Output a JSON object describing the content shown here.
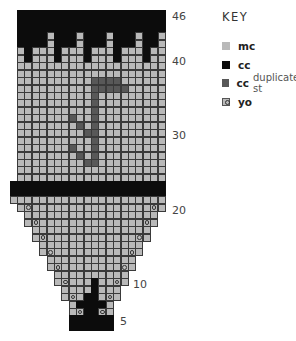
{
  "key": {
    "title": "KEY",
    "items": [
      {
        "name": "mc",
        "label": "mc",
        "sub": "",
        "color": "#b9b9b9",
        "type": "square"
      },
      {
        "name": "cc",
        "label": "cc",
        "sub": "",
        "color": "#0c0c0c",
        "type": "square"
      },
      {
        "name": "cc-duplicate",
        "label": "cc",
        "sub": "duplicate st",
        "color": "#585858",
        "type": "square"
      },
      {
        "name": "yo",
        "label": "yo",
        "sub": "",
        "color": "#b9b9b9",
        "type": "circle"
      }
    ]
  },
  "chart_data": {
    "type": "heatmap",
    "cols": 21,
    "row_min": 4,
    "row_max": 46,
    "row_labels": [
      46,
      40,
      30,
      20,
      10,
      5
    ],
    "legend": {
      "M": "mc",
      "C": "cc",
      "D": "cc duplicate st",
      "O": "yo",
      ".": "none"
    },
    "rows": {
      "46": ".CCCCCCCCCCCCCCCCCCCC",
      "45": ".CCCCCCCCCCCCCCCCCCCC",
      "44": ".CCCCCCCCCCCCCCCCCCCC",
      "43": ".CCCCMCCCMCCCMCCCMCCM",
      "42": ".CCCCMCCCMCCCMCCCMCCM",
      "41": ".MCMMMCMMMCMMMCMMMCMM",
      "40": ".MCMMMCMMMCMMMCMMMCMM",
      "39": ".MMMMMMMMMMMMMMMMMMMM",
      "38": ".MMMMMMMMMMMMMMMMMMMM",
      "37": ".MMMMMMMMMMDDDDMMMMMM",
      "36": ".MMMMMMMMMMDDDDDMMMMM",
      "35": ".MMMMMMMMMMDMMMMMMMMM",
      "34": ".MMMMMMMMMMDMMMMMMMMM",
      "33": ".MMMMMMMMMMDMMMMMMMMM",
      "32": ".MMMMMMMDMMDMMMMMMMMM",
      "31": ".MMMMMMMMDMDMMMMMMMMM",
      "30": ".MMMMMMMMMDDMMMMMMMMM",
      "29": ".MMMMMMMMMMDMMMMMMMMM",
      "28": ".MMMMMMMDMMDMMMMMMMMM",
      "27": ".MMMMMMMMDMDMMMMMMMMM",
      "26": ".MMMMMMMMMDDMMMMMMMMM",
      "25": ".MMMMMMMMMMMMMMMMMMMM",
      "24": ".MMMMMMMMMMMMMMMMMMMM",
      "23": "CCCCCCCCCCCCCCCCCCCCC",
      "22": "CCCCCCCCCCCCCCCCCCCCC",
      "21": "MMMMMMMMMMMMMMMMMMMMM",
      "20": ".MOMMMMMMMMMMMMMMMMOM",
      "19": "..MMMMMMMMMMMMMMMMMM.",
      "18": "..MOMMMMMMMMMMMMMMOM.",
      "17": "...MMMMMMMMMMMMMMMM..",
      "16": "...MOMMMMMMMMMMMMOM..",
      "15": "....MMMMMMMMMMMMMM...",
      "14": "....MOMMMMMMMMMMOM...",
      "13": ".....MMMMMMMMMMMM....",
      "12": ".....MOMMMMMMMMOM....",
      "11": "......MMMMMMMMMM.....",
      "10": "......MOMMMCMMOM.....",
      "9": ".......MMMMCMMM......",
      "8": ".......MOMCCMOM......",
      "7": "........MCCCCM.......",
      "6": "........MOCCOM.......",
      "5": "........CCCCCC.......",
      "4": "........CCCCCC......."
    }
  }
}
